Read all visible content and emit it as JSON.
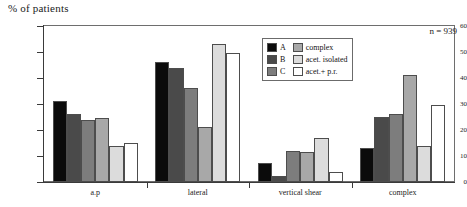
{
  "chart_data": {
    "type": "bar",
    "title": "% of patients",
    "xlabel": "",
    "ylabel": "% of patients",
    "ylim": [
      0,
      60
    ],
    "yticks": [
      0,
      10,
      20,
      30,
      40,
      50,
      60
    ],
    "ytick_labels": [
      "0",
      "10",
      "20",
      "30",
      "40",
      "50",
      "60"
    ],
    "grid": false,
    "legend_position": "upper-center-right",
    "annotation": "n = 939",
    "categories": [
      "a.p",
      "lateral",
      "vertical shear",
      "complex"
    ],
    "series": [
      {
        "name": "A",
        "color": "#0b0b0b",
        "values": [
          31,
          46,
          7.5,
          13
        ]
      },
      {
        "name": "B",
        "color": "#4a4a4a",
        "values": [
          26,
          44,
          2.5,
          25
        ]
      },
      {
        "name": "C",
        "color": "#7d7d7d",
        "values": [
          24,
          36,
          12,
          26
        ]
      },
      {
        "name": "complex",
        "color": "#a8a8a8",
        "values": [
          24.5,
          21,
          11.5,
          41
        ]
      },
      {
        "name": "acet. isolated",
        "color": "#dcdcdc",
        "values": [
          14,
          53,
          17,
          14
        ]
      },
      {
        "name": "acet.+ p.r.",
        "color": "#ffffff",
        "values": [
          15,
          49.5,
          4,
          29.5
        ]
      }
    ]
  },
  "legend": {
    "columns": [
      {
        "items": [
          {
            "label": "A",
            "color": "#0b0b0b"
          },
          {
            "label": "B",
            "color": "#4a4a4a"
          },
          {
            "label": "C",
            "color": "#7d7d7d"
          }
        ]
      },
      {
        "items": [
          {
            "label": "complex",
            "color": "#a8a8a8"
          },
          {
            "label": "acet. isolated",
            "color": "#dcdcdc"
          },
          {
            "label": "acet.+ p.r.",
            "color": "#ffffff"
          }
        ]
      }
    ]
  }
}
